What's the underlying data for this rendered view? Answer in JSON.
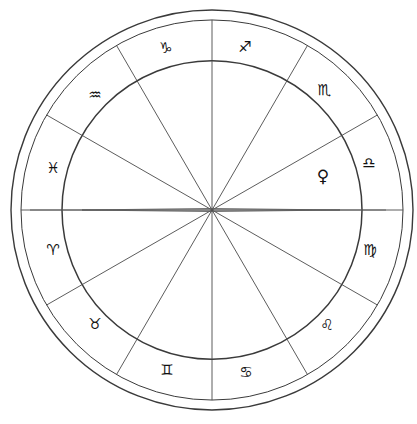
{
  "chart_data": {
    "type": "scatter",
    "subtitle": "Twelve-house zodiac wheel with equal 30-degree sign divisions",
    "xlabel": "",
    "ylabel": "",
    "grid": false,
    "legend_position": "none",
    "center": {
      "x": 212,
      "y": 210
    },
    "radii": {
      "outer_circle": 201,
      "second_circle": 191,
      "inner_wheel": 150
    },
    "house_count": 12,
    "degrees_per_house": 30,
    "ascendant_axis": {
      "label": "Ascendant-Descendant horizontal axis",
      "left_x": 30,
      "right_x": 386,
      "y": 210,
      "needle_left_x": 82,
      "needle_right_x": 340
    },
    "signs": [
      {
        "name": "Sagittarius",
        "glyph": "♐",
        "ring_angle_deg": 75,
        "label_x": 245,
        "label_y": 47
      },
      {
        "name": "Capricorn",
        "glyph": "♑",
        "ring_angle_deg": 105,
        "label_x": 166,
        "label_y": 48
      },
      {
        "name": "Aquarius",
        "glyph": "♒",
        "ring_angle_deg": 135,
        "label_x": 95,
        "label_y": 95
      },
      {
        "name": "Pisces",
        "glyph": "♓",
        "ring_angle_deg": 165,
        "label_x": 53,
        "label_y": 168
      },
      {
        "name": "Aries",
        "glyph": "♈",
        "ring_angle_deg": 195,
        "label_x": 53,
        "label_y": 250
      },
      {
        "name": "Taurus",
        "glyph": "♉",
        "ring_angle_deg": 225,
        "label_x": 95,
        "label_y": 324
      },
      {
        "name": "Gemini",
        "glyph": "♊",
        "ring_angle_deg": 255,
        "label_x": 167,
        "label_y": 370
      },
      {
        "name": "Cancer",
        "glyph": "♋",
        "ring_angle_deg": 285,
        "label_x": 246,
        "label_y": 372
      },
      {
        "name": "Leo",
        "glyph": "♌",
        "ring_angle_deg": 315,
        "label_x": 327,
        "label_y": 325
      },
      {
        "name": "Virgo",
        "glyph": "♍",
        "ring_angle_deg": 345,
        "label_x": 370,
        "label_y": 250
      },
      {
        "name": "Libra",
        "glyph": "♎",
        "ring_angle_deg": 15,
        "label_x": 369,
        "label_y": 163
      },
      {
        "name": "Scorpio",
        "glyph": "♏",
        "ring_angle_deg": 45,
        "label_x": 324,
        "label_y": 90
      }
    ],
    "planets": [
      {
        "name": "Venus",
        "glyph": "♀",
        "in_sign": "Libra",
        "label_x": 323,
        "label_y": 176
      }
    ],
    "spoke_angles_deg": [
      0,
      30,
      60,
      90,
      120,
      150,
      180,
      210,
      240,
      270,
      300,
      330
    ],
    "colors": {
      "background": "#ffffff",
      "stroke": "#3a3a3a",
      "spoke": "#4a4a4a",
      "glyph": "#111111"
    }
  }
}
